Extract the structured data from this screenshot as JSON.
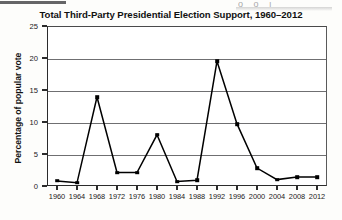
{
  "artifacts": {
    "top_right_marks": "o o  ı"
  },
  "chart_data": {
    "type": "line",
    "title": "Total Third-Party Presidential Election Support, 1960–2012",
    "xlabel": "",
    "ylabel": "Percentage of popular vote",
    "categories": [
      "1960",
      "1964",
      "1968",
      "1972",
      "1976",
      "1980",
      "1984",
      "1988",
      "1992",
      "1996",
      "2000",
      "2004",
      "2008",
      "2012"
    ],
    "values": [
      0.8,
      0.5,
      13.9,
      2.1,
      2.1,
      8.0,
      0.7,
      0.9,
      19.5,
      9.7,
      2.8,
      1.0,
      1.4,
      1.4
    ],
    "ylim": [
      0,
      25
    ],
    "yticks": [
      0,
      5,
      10,
      15,
      20,
      25
    ],
    "ytick_labels": [
      "0",
      "5",
      "10",
      "15",
      "20",
      "25"
    ],
    "grid": true,
    "grid_axis": "y",
    "legend": false,
    "legend_position": "none",
    "series_color": "#000000",
    "marker": "square",
    "grid_color": "#6f6f71",
    "axis_color": "#2b2b2b",
    "background_color": "#ffffff"
  }
}
